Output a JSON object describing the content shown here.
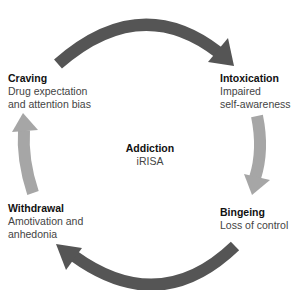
{
  "diagram": {
    "center": {
      "title": "Addiction",
      "subtitle": "iRISA"
    },
    "stages": [
      {
        "title": "Craving",
        "description": "Drug expectation\nand attention bias"
      },
      {
        "title": "Intoxication",
        "description": "Impaired\nself-awareness"
      },
      {
        "title": "Bingeing",
        "description": "Loss of control"
      },
      {
        "title": "Withdrawal",
        "description": "Amotivation and\nanhedonia"
      }
    ],
    "colors": {
      "dark_arrow": "#555555",
      "light_arrow": "#a6a6a6"
    }
  }
}
